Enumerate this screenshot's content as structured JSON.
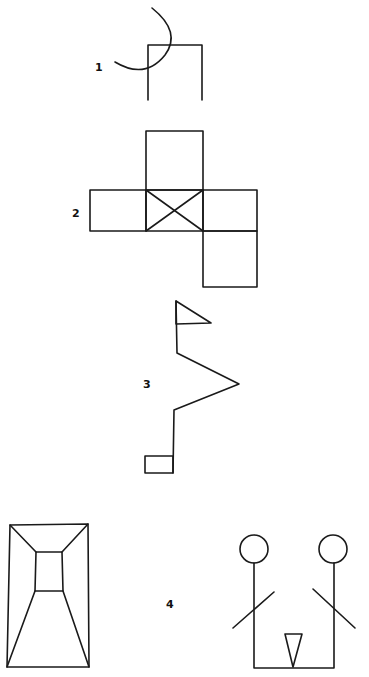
{
  "figures": [
    {
      "label": "1",
      "description": "Open-bottom square with intersecting arc"
    },
    {
      "label": "2",
      "description": "Cross of squares with X in center square"
    },
    {
      "label": "3",
      "description": "Zig-zag line with flag at top and small rectangle at bottom"
    },
    {
      "label": "4",
      "description": "Corridor perspective box and two stick figures joined with triangle"
    }
  ],
  "colors": {
    "ink": "#1a1a1a",
    "background": "#ffffff"
  }
}
